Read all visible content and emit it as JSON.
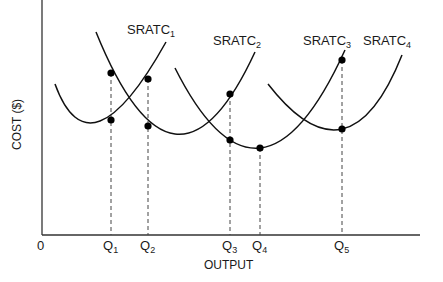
{
  "chart_data": {
    "type": "line",
    "title": "",
    "xlabel": "OUTPUT",
    "ylabel": "COST ($)",
    "origin_label": "0",
    "grid": false,
    "legend": "none (curves labeled directly)",
    "x_ticks": [
      {
        "base": "Q",
        "sub": "1",
        "x": 111
      },
      {
        "base": "Q",
        "sub": "2",
        "x": 148
      },
      {
        "base": "Q",
        "sub": "3",
        "x": 230
      },
      {
        "base": "Q",
        "sub": "4",
        "x": 260
      },
      {
        "base": "Q",
        "sub": "5",
        "x": 342
      }
    ],
    "series": [
      {
        "name": "SRATC1",
        "base": "SRATC",
        "sub": "1",
        "shape": "U-curve",
        "path": [
          [
            55,
            84
          ],
          [
            100,
            121
          ],
          [
            166,
            42
          ]
        ],
        "label_pos": [
          127,
          22
        ]
      },
      {
        "name": "SRATC2",
        "base": "SRATC",
        "sub": "2",
        "shape": "U-curve",
        "path": [
          [
            96,
            32
          ],
          [
            175,
            134
          ],
          [
            255,
            52
          ]
        ],
        "label_pos": [
          213,
          33
        ]
      },
      {
        "name": "SRATC3",
        "base": "SRATC",
        "sub": "3",
        "shape": "U-curve",
        "path": [
          [
            175,
            68
          ],
          [
            260,
            148
          ],
          [
            345,
            50
          ]
        ],
        "label_pos": [
          303,
          33
        ]
      },
      {
        "name": "SRATC4",
        "base": "SRATC",
        "sub": "4",
        "shape": "U-curve",
        "path": [
          [
            268,
            84
          ],
          [
            342,
            129
          ],
          [
            402,
            55
          ]
        ],
        "label_pos": [
          363,
          33
        ]
      }
    ],
    "points": [
      {
        "q": "Q1",
        "x": 111,
        "y": 73,
        "curve": "SRATC2"
      },
      {
        "q": "Q1",
        "x": 111,
        "y": 120,
        "curve": "SRATC1"
      },
      {
        "q": "Q2",
        "x": 148,
        "y": 79,
        "curve": "SRATC1"
      },
      {
        "q": "Q2",
        "x": 148,
        "y": 126,
        "curve": "SRATC2"
      },
      {
        "q": "Q3",
        "x": 230,
        "y": 94,
        "curve": "SRATC2"
      },
      {
        "q": "Q3",
        "x": 230,
        "y": 140,
        "curve": "SRATC3"
      },
      {
        "q": "Q4",
        "x": 260,
        "y": 148,
        "curve": "SRATC3"
      },
      {
        "q": "Q5",
        "x": 342,
        "y": 60,
        "curve": "SRATC3"
      },
      {
        "q": "Q5",
        "x": 342,
        "y": 129,
        "curve": "SRATC4"
      }
    ],
    "axes": {
      "origin": [
        42,
        235
      ],
      "x_end": 420,
      "y_top": 0
    }
  }
}
